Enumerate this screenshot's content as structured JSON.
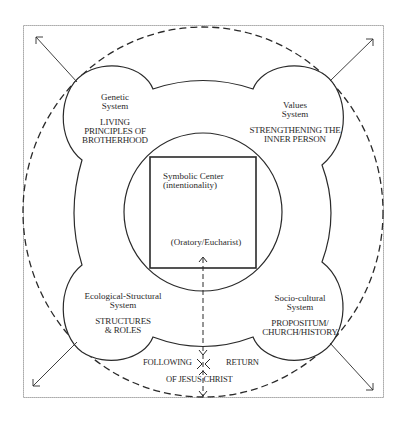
{
  "diagram": {
    "colors": {
      "stroke": "#2a2a2a",
      "frame": "#777777",
      "background": "#ffffff"
    },
    "systems": [
      {
        "id": "genetic",
        "position": "top-left",
        "name_lines": [
          "Genetic",
          "System"
        ],
        "theme_lines": [
          "LIVING",
          "PRINCIPLES OF",
          "BROTHERHOOD"
        ]
      },
      {
        "id": "values",
        "position": "top-right",
        "name_lines": [
          "Values",
          "System"
        ],
        "theme_lines": [
          "STRENGTHENING THE",
          "INNER PERSON"
        ]
      },
      {
        "id": "ecological-structural",
        "position": "bottom-left",
        "name_lines": [
          "Ecological-Structural",
          "System"
        ],
        "theme_lines": [
          "STRUCTURES",
          "& ROLES"
        ]
      },
      {
        "id": "socio-cultural",
        "position": "bottom-right",
        "name_lines": [
          "Socio-cultural",
          "System"
        ],
        "theme_lines": [
          "PROPOSITUM/",
          "CHURCH/HISTORY"
        ]
      }
    ],
    "center": {
      "title_lines": [
        "Symbolic Center",
        "(intentionality)"
      ],
      "subtitle": "(Oratory/Eucharist)"
    },
    "path": {
      "left_label": "FOLLOWING",
      "right_label": "RETURN",
      "bottom_label": "OF JESUS CHRIST"
    },
    "arrows": [
      "top-left",
      "top-right",
      "bottom-left",
      "bottom-right"
    ]
  }
}
